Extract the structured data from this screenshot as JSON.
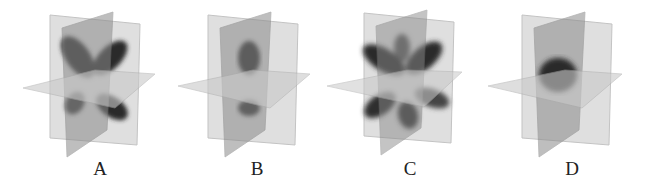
{
  "figure": {
    "panels": [
      {
        "label": "A",
        "shape": "four-lobed cloverleaf orbital (d-type)",
        "offset_x": 0
      },
      {
        "label": "B",
        "shape": "two-lobed dumbbell orbital along vertical axis (p-type)",
        "offset_x": 158
      },
      {
        "label": "C",
        "shape": "multi-lobed orbital with six lobes (f-type)",
        "offset_x": 312
      },
      {
        "label": "D",
        "shape": "spherical orbital (s-type)",
        "offset_x": 470
      }
    ],
    "colors": {
      "background": "#ffffff",
      "back_plane": "#d9d9d9",
      "dark_plane": "#8c8c8c",
      "horizontal_plane": "#c8c8c8",
      "lobe": "#2a2a2a",
      "label_text": "#222222"
    }
  }
}
